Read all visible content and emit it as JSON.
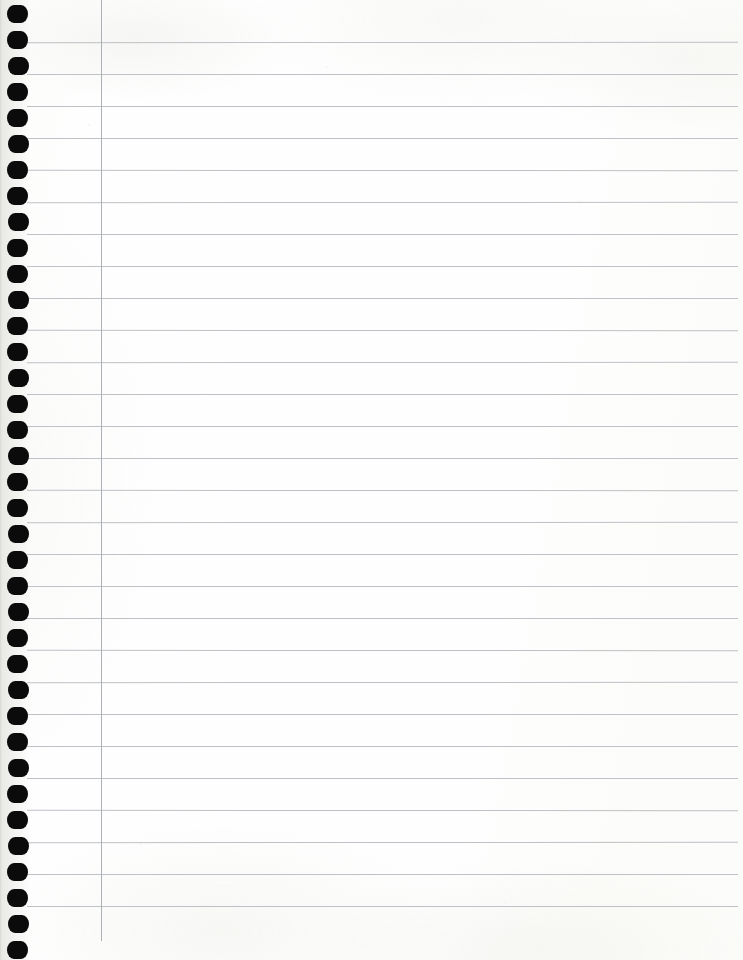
{
  "document": {
    "type": "notebook-page-scan",
    "title": "Blank spiral notebook page",
    "description": "Scanned blank sheet of college-ruled spiral-bound notebook paper",
    "page_width": 743,
    "page_height": 960,
    "written_content": "",
    "text_lines": []
  },
  "paper": {
    "background_color": "#fdfdfc",
    "edge_tint_color": "#f7f7f5",
    "rule_color": "#b9bcc2",
    "margin_rule_color": "#a9acb3",
    "hole_color": "#0b0b0b"
  },
  "ruling": {
    "style": "college-ruled",
    "line_count": 28,
    "line_spacing_px": 32,
    "first_line_y": 42,
    "line_start_x": 27,
    "line_end_x": 738,
    "line_thickness_px": 1,
    "lines_y": [
      42,
      74,
      106,
      138,
      170,
      202,
      234,
      266,
      298,
      330,
      362,
      394,
      426,
      458,
      490,
      522,
      554,
      586,
      618,
      650,
      682,
      714,
      746,
      778,
      810,
      842,
      874,
      906
    ]
  },
  "margin_rule": {
    "orientation": "vertical",
    "x": 101,
    "y_start": 0,
    "y_end": 941,
    "thickness_px": 1
  },
  "binding": {
    "type": "spiral",
    "edge": "left",
    "hole_count": 37,
    "hole_spacing_px": 26,
    "first_hole_y": 5,
    "hole_x": 7,
    "hole_width": 21,
    "hole_height": 18,
    "holes_y": [
      5,
      31,
      57,
      83,
      109,
      135,
      161,
      187,
      213,
      239,
      265,
      291,
      317,
      343,
      369,
      395,
      421,
      447,
      473,
      499,
      525,
      551,
      577,
      603,
      629,
      655,
      681,
      707,
      733,
      759,
      785,
      811,
      837,
      863,
      889,
      915,
      941
    ]
  }
}
